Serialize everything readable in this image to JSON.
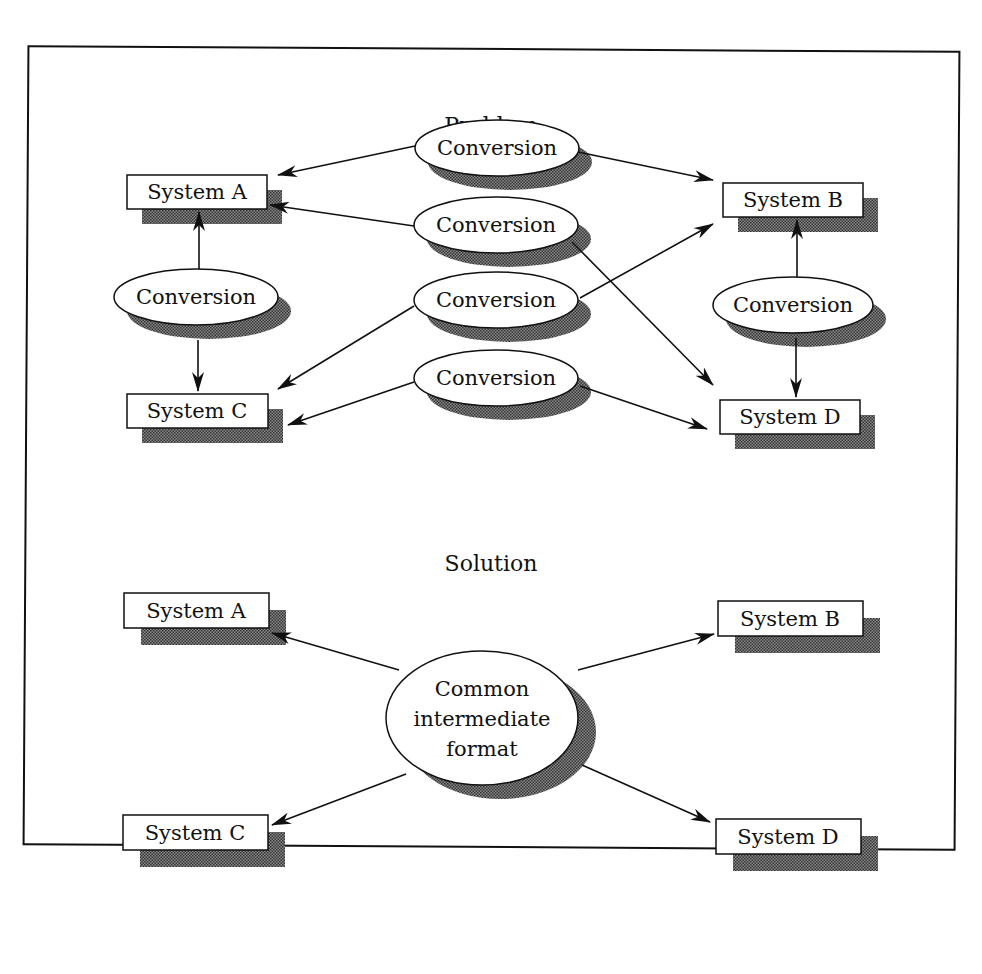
{
  "problem": {
    "title": "Problem",
    "systems": [
      {
        "id": "A",
        "label": "System A",
        "x": 127,
        "y": 175,
        "w": 140,
        "h": 34
      },
      {
        "id": "B",
        "label": "System B",
        "x": 723,
        "y": 183,
        "w": 140,
        "h": 34
      },
      {
        "id": "C",
        "label": "System C",
        "x": 127,
        "y": 394,
        "w": 141,
        "h": 34
      },
      {
        "id": "D",
        "label": "System D",
        "x": 720,
        "y": 400,
        "w": 140,
        "h": 34
      }
    ],
    "conversions": [
      {
        "label": "Conversion",
        "cx": 497,
        "cy": 148,
        "rx": 82,
        "ry": 28
      },
      {
        "label": "Conversion",
        "cx": 496,
        "cy": 225,
        "rx": 82,
        "ry": 28
      },
      {
        "label": "Conversion",
        "cx": 196,
        "cy": 297,
        "rx": 82,
        "ry": 28
      },
      {
        "label": "Conversion",
        "cx": 496,
        "cy": 300,
        "rx": 82,
        "ry": 28
      },
      {
        "label": "Conversion",
        "cx": 793,
        "cy": 305,
        "rx": 80,
        "ry": 28
      },
      {
        "label": "Conversion",
        "cx": 496,
        "cy": 378,
        "rx": 82,
        "ry": 28
      }
    ]
  },
  "solution": {
    "title": "Solution",
    "systems": [
      {
        "id": "A",
        "label": "System A",
        "x": 124,
        "y": 593,
        "w": 145,
        "h": 35
      },
      {
        "id": "B",
        "label": "System B",
        "x": 718,
        "y": 601,
        "w": 145,
        "h": 35
      },
      {
        "id": "C",
        "label": "System C",
        "x": 123,
        "y": 815,
        "w": 145,
        "h": 35
      },
      {
        "id": "D",
        "label": "System D",
        "x": 716,
        "y": 819,
        "w": 145,
        "h": 35
      }
    ],
    "hub": {
      "lines": [
        "Common",
        "intermediate",
        "format"
      ],
      "cx": 482,
      "cy": 718,
      "rx": 96,
      "ry": 67
    }
  },
  "colors": {
    "ink": "#111111",
    "shadow": "#6e6e6e",
    "background": "#ffffff"
  }
}
